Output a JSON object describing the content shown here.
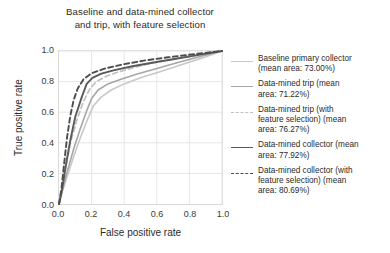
{
  "chart_data": {
    "type": "line",
    "title": "Baseline and data-mined collector and trip, with feature selection",
    "title_line1": "Baseline and data-mined collector",
    "title_line2": "and trip, with feature selection",
    "xlabel": "False positive rate",
    "ylabel": "True positive rate",
    "xlim": [
      0.0,
      1.0
    ],
    "ylim": [
      0.0,
      1.0
    ],
    "xticks": [
      "0.0",
      "0.2",
      "0.4",
      "0.6",
      "0.8",
      "1.0"
    ],
    "yticks": [
      "0.0",
      "0.2",
      "0.4",
      "0.6",
      "0.8",
      "1.0"
    ],
    "xtick_values": [
      0.0,
      0.2,
      0.4,
      0.6,
      0.8,
      1.0
    ],
    "ytick_values": [
      0.0,
      0.2,
      0.4,
      0.6,
      0.8,
      1.0
    ],
    "grid": true,
    "legend_position": "right-outside",
    "legend_frame": false,
    "series": [
      {
        "name": "Baseline primary collector (mean area: 73.00%)",
        "label_line1": "Baseline primary collector",
        "label_line2": "(mean area: 73.00%)",
        "mean_area_pct": 73.0,
        "color": "#c8c8c8",
        "dash": "solid",
        "width": 1.6,
        "x": [
          0.0,
          0.02,
          0.05,
          0.09,
          0.13,
          0.17,
          0.21,
          0.26,
          0.32,
          0.4,
          0.5,
          0.62,
          0.75,
          0.88,
          1.0
        ],
        "y": [
          0.0,
          0.08,
          0.18,
          0.31,
          0.43,
          0.54,
          0.64,
          0.7,
          0.745,
          0.785,
          0.825,
          0.865,
          0.91,
          0.955,
          1.0
        ]
      },
      {
        "name": "Data-mined trip (mean area: 71.22%)",
        "label_line1": "Data-mined trip (mean",
        "label_line2": "area: 71.22%)",
        "mean_area_pct": 71.22,
        "color": "#a6a6a6",
        "dash": "solid",
        "width": 1.6,
        "x": [
          0.0,
          0.02,
          0.05,
          0.09,
          0.13,
          0.17,
          0.2,
          0.24,
          0.3,
          0.38,
          0.48,
          0.6,
          0.73,
          0.86,
          1.0
        ],
        "y": [
          0.0,
          0.09,
          0.21,
          0.36,
          0.49,
          0.61,
          0.69,
          0.745,
          0.785,
          0.815,
          0.85,
          0.885,
          0.925,
          0.962,
          1.0
        ]
      },
      {
        "name": "Data-mined trip (with feature selection) (mean area: 76.27%)",
        "label_line1": "Data-mined trip (with",
        "label_line2": "feature selection) (mean",
        "label_line3": "area: 76.27%)",
        "mean_area_pct": 76.27,
        "color": "#c0c0c0",
        "dash": "dashed",
        "width": 1.7,
        "x": [
          0.0,
          0.02,
          0.04,
          0.07,
          0.11,
          0.15,
          0.19,
          0.23,
          0.29,
          0.37,
          0.47,
          0.59,
          0.72,
          0.86,
          1.0
        ],
        "y": [
          0.0,
          0.1,
          0.23,
          0.4,
          0.55,
          0.67,
          0.755,
          0.8,
          0.835,
          0.865,
          0.895,
          0.925,
          0.952,
          0.977,
          1.0
        ]
      },
      {
        "name": "Data-mined collector (mean area: 77.92%)",
        "label_line1": "Data-mined collector (mean",
        "label_line2": "area: 77.92%)",
        "mean_area_pct": 77.92,
        "color": "#5a5a5a",
        "dash": "solid",
        "width": 1.9,
        "x": [
          0.0,
          0.02,
          0.04,
          0.07,
          0.1,
          0.14,
          0.17,
          0.205,
          0.26,
          0.34,
          0.45,
          0.58,
          0.71,
          0.85,
          1.0
        ],
        "y": [
          0.0,
          0.1,
          0.24,
          0.42,
          0.57,
          0.7,
          0.785,
          0.825,
          0.852,
          0.875,
          0.9,
          0.925,
          0.948,
          0.973,
          1.0
        ]
      },
      {
        "name": "Data-mined collector (with feature selection) (mean area: 80.69%)",
        "label_line1": "Data-mined collector (with",
        "label_line2": "feature selection) (mean",
        "label_line3": "area: 80.69%)",
        "mean_area_pct": 80.69,
        "color": "#4d4d4d",
        "dash": "dashed",
        "width": 1.9,
        "x": [
          0.0,
          0.015,
          0.03,
          0.05,
          0.07,
          0.09,
          0.115,
          0.15,
          0.2,
          0.28,
          0.39,
          0.52,
          0.67,
          0.83,
          1.0
        ],
        "y": [
          0.0,
          0.1,
          0.25,
          0.44,
          0.58,
          0.68,
          0.755,
          0.815,
          0.855,
          0.885,
          0.912,
          0.937,
          0.959,
          0.98,
          1.0
        ]
      }
    ]
  }
}
